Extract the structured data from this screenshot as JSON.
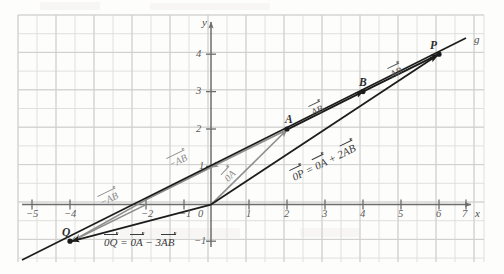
{
  "figure": {
    "kind": "coordinate-plane-vector-diagram"
  },
  "axes": {
    "x_label": "x",
    "y_label": "y",
    "origin_label": "0",
    "x_ticks": [
      "−5",
      "−4",
      "−3",
      "−2",
      "−1",
      "1",
      "2",
      "3",
      "4",
      "5",
      "6",
      "7"
    ],
    "x_tick_values": [
      -5,
      -4,
      -3,
      -2,
      -1,
      1,
      2,
      3,
      4,
      5,
      6,
      7
    ],
    "x_tick_shown": [
      true,
      true,
      false,
      true,
      true,
      true,
      true,
      true,
      true,
      true,
      true,
      true
    ],
    "y_ticks": [
      "−1",
      "1",
      "2",
      "3",
      "4"
    ],
    "y_tick_values": [
      -1,
      1,
      2,
      3,
      4
    ],
    "x_range": [
      -5.2,
      7.2
    ],
    "y_range": [
      -1.6,
      4.8
    ],
    "grid": true,
    "grid_color": "#d8d8d8"
  },
  "points": [
    {
      "name": "Q",
      "label": "Q",
      "x": -4,
      "y": -1
    },
    {
      "name": "A",
      "label": "A",
      "x": 2,
      "y": 2
    },
    {
      "name": "B",
      "label": "B",
      "x": 4,
      "y": 3
    },
    {
      "name": "P",
      "label": "P",
      "x": 6,
      "y": 4
    }
  ],
  "line": {
    "name": "g",
    "label": "g",
    "color": "#1c1c1c",
    "from": {
      "x": -5.1,
      "y": -1.55
    },
    "to": {
      "x": 6.9,
      "y": 4.45
    }
  },
  "vectors": {
    "oa_label": "0A",
    "ab_label": "AB",
    "neg_ab_label": "−AB",
    "op_equation": "0P = 0A + 2AB",
    "oq_equation": "0Q = 0A − 3AB",
    "gray_color": "#8e8e8e",
    "black_color": "#1c1c1c"
  },
  "vector_labels": [
    {
      "id": "oa",
      "text": "0A",
      "x": 0.28,
      "y": 0.78,
      "rotate": -47,
      "shade": "gray"
    },
    {
      "id": "negab-1",
      "text": "−AB",
      "x": -1.05,
      "y": 1.62,
      "rotate": -26,
      "shade": "gray"
    },
    {
      "id": "negab-2",
      "text": "−AB",
      "x": -3.15,
      "y": 0.24,
      "rotate": -26,
      "shade": "gray"
    },
    {
      "id": "ab-1",
      "text": "AB",
      "x": 2.7,
      "y": 2.95,
      "rotate": -26,
      "shade": "black"
    },
    {
      "id": "ab-2",
      "text": "AB",
      "x": 4.75,
      "y": 3.95,
      "rotate": -26,
      "shade": "black"
    }
  ],
  "equations": [
    {
      "id": "op",
      "text": "0P = 0A + 2AB",
      "x": 2.35,
      "y": 1.52,
      "rotate": -26
    },
    {
      "id": "oq",
      "text": "0Q = 0A − 3AB",
      "x": -2.75,
      "y": -1.12,
      "rotate": 0
    }
  ]
}
